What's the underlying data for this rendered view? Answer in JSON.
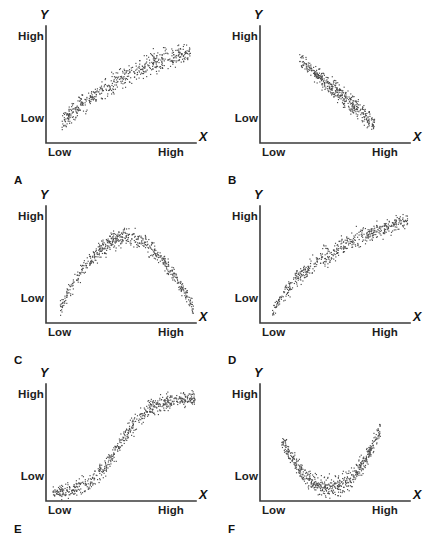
{
  "figure": {
    "background_color": "#ffffff",
    "axis_color": "#3b3b3b",
    "dot_color": "#4a4a4a"
  },
  "labels": {
    "y_axis_name": "Y",
    "x_axis_name": "X",
    "high": "High",
    "low": "Low"
  },
  "chart_data": {
    "type": "scatter",
    "xlabel": "X",
    "ylabel": "Y",
    "xtick_labels": [
      "Low",
      "High"
    ],
    "ytick_labels": [
      "Low",
      "High"
    ],
    "xlim": [
      0,
      1
    ],
    "ylim": [
      0,
      1
    ],
    "grid": false,
    "legend": "none",
    "panels": [
      {
        "letter": "A",
        "relationship": "strong positive linear",
        "band": {
          "shape": "linear",
          "x_start": 0.1,
          "x_end": 0.96,
          "y_start": 0.18,
          "y_end": 0.78,
          "thickness": 0.13,
          "curvature": 0.1
        },
        "n_points": 520
      },
      {
        "letter": "B",
        "relationship": "strong negative linear",
        "band": {
          "shape": "linear",
          "x_start": 0.26,
          "x_end": 0.76,
          "y_start": 0.72,
          "y_end": 0.17,
          "thickness": 0.11,
          "curvature": 0.0
        },
        "n_points": 430
      },
      {
        "letter": "C",
        "relationship": "inverted-U curvilinear",
        "band": {
          "shape": "inverted-u",
          "x_start": 0.09,
          "x_end": 0.98,
          "y_peak": 0.74,
          "y_ends": 0.12,
          "thickness": 0.1
        },
        "n_points": 560
      },
      {
        "letter": "D",
        "relationship": "positive decelerating (logarithmic)",
        "band": {
          "shape": "log",
          "x_start": 0.08,
          "x_end": 0.98,
          "y_start": 0.1,
          "y_end": 0.88,
          "thickness": 0.11
        },
        "n_points": 520
      },
      {
        "letter": "E",
        "relationship": "S-shaped (sigmoid)",
        "band": {
          "shape": "sigmoid",
          "x_start": 0.04,
          "x_end": 0.99,
          "y_start": 0.08,
          "y_end": 0.88,
          "thickness": 0.1
        },
        "n_points": 600
      },
      {
        "letter": "F",
        "relationship": "U-shaped curvilinear",
        "band": {
          "shape": "u",
          "x_start": 0.14,
          "x_end": 0.8,
          "y_trough": 0.12,
          "y_ends": 0.58,
          "thickness": 0.11
        },
        "n_points": 560
      }
    ]
  }
}
